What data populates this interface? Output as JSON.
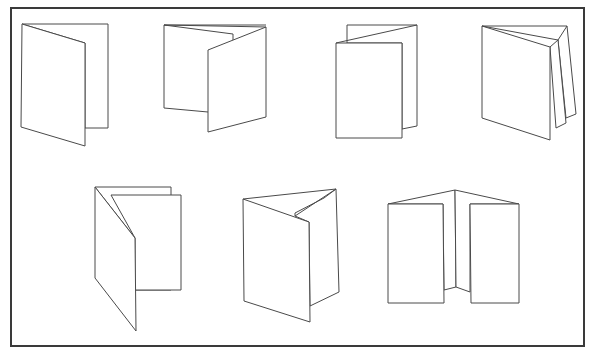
{
  "diagram": {
    "colors": {
      "background": "#ffffff",
      "line": "#4a4a4a",
      "frame": "#3a3a3a"
    },
    "frame": {
      "x": 11,
      "y": 8,
      "width": 573,
      "height": 338
    },
    "figures": [
      {
        "id": "fold-1",
        "label": "single fold (bifold)",
        "polygons": [
          "22,24 108,24 108,128 85,128 85,43",
          "22,24 85,43 85,146 21,127"
        ],
        "lines": []
      },
      {
        "id": "fold-2",
        "label": "letter fold (trifold)",
        "polygons": [
          "164,25 233,34 233,116 208,112 164,108",
          "208,50 266,27 266,117 208,132"
        ],
        "lines": [
          "164,25 266,25",
          "164,25 266,27"
        ]
      },
      {
        "id": "fold-3",
        "label": "short fold",
        "polygons": [
          "347,25 417,25 417,126 402,129 402,43 347,43",
          "336,43 402,43 402,138 336,138"
        ],
        "lines": [
          "336,43 417,25"
        ]
      },
      {
        "id": "fold-4",
        "label": "accordion fold",
        "polygons": [
          "567,26 576,114 566,118 558,40",
          "558,40 566,123 556,128 550,47",
          "482,26 550,47 550,140 482,118"
        ],
        "lines": [
          "482,26 567,26",
          "482,26 558,40"
        ]
      },
      {
        "id": "fold-5",
        "label": "gate style roll fold",
        "polygons": [
          "95,187 171,187 171,290 135,290 135,238",
          "111,195 181,195 181,290 135,290 135,238",
          "95,187 135,238 136,331 95,278"
        ],
        "lines": []
      },
      {
        "id": "fold-6",
        "label": "roll fold",
        "polygons": [
          "336,189 339,292 310,306 309,222 295,216",
          "243,199 309,222 310,322 244,301"
        ],
        "lines": [
          "243,199 336,189",
          "295,213 324,198",
          "295,213 295,216",
          "324,198 336,189"
        ]
      },
      {
        "id": "fold-7",
        "label": "gate fold",
        "polygons": [
          "388,204 455,190 456,287 444,290 443,204",
          "455,190 519,204 470,204 470,292 456,287",
          "388,204 443,204 444,303 388,303",
          "470,204 519,204 519,303 471,303"
        ],
        "lines": []
      }
    ]
  }
}
